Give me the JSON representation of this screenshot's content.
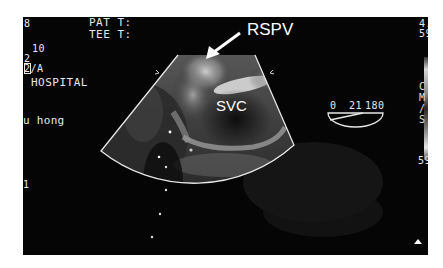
{
  "overlay_left": {
    "index_top": "8",
    "depth": "10",
    "line2": "2",
    "mode_prefix": "2",
    "mode_suffix": "/A",
    "hospital": "HOSPITAL",
    "operator": "u hong",
    "index_bottom": "1"
  },
  "overlay_top": {
    "pat_temp_label": "PAT T:",
    "tee_temp_label": "TEE T:"
  },
  "annotations": {
    "arrow_label": "RSPV",
    "structure_label": "SVC"
  },
  "probe_angle": {
    "min": "0",
    "current": "21",
    "max": "180"
  },
  "color_scale": {
    "top_value_line1": "4.",
    "top_value_line2": "59",
    "unit_chars": [
      "C",
      "M",
      "/",
      "S"
    ],
    "bottom_value": "59"
  },
  "colors": {
    "background": "#050505",
    "overlay_text": "#e8e8e8",
    "page": "#ffffff"
  }
}
